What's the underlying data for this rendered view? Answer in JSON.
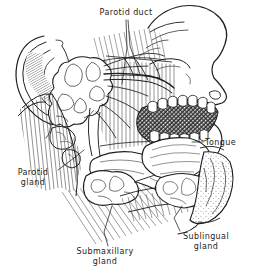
{
  "figure": {
    "style": "pen-and-ink engraving, black line art on white",
    "background_color": "#ffffff",
    "ink_color": "#1d1d1d"
  },
  "labels": [
    {
      "id": "parotid-duct",
      "text": "Parotid duct",
      "lines": [
        "Parotid duct"
      ],
      "position": "top-center"
    },
    {
      "id": "parotid-gland",
      "text": "Parotid gland",
      "lines": [
        "Parotid",
        "gland"
      ],
      "position": "left"
    },
    {
      "id": "tongue",
      "text": "Tongue",
      "lines": [
        "Tongue"
      ],
      "position": "right"
    },
    {
      "id": "submaxillary-gland",
      "text": "Submaxillary gland",
      "lines": [
        "Submaxillary",
        "gland"
      ],
      "position": "bottom-center"
    },
    {
      "id": "sublingual-gland",
      "text": "Sublingual gland",
      "lines": [
        "Sublingual",
        "gland"
      ],
      "position": "bottom-right"
    }
  ],
  "label_text": {
    "parotid_duct": "Parotid duct",
    "parotid_gland_line1": "Parotid",
    "parotid_gland_line2": "gland",
    "tongue": "Tongue",
    "submaxillary_line1": "Submaxillary",
    "submaxillary_line2": "gland",
    "sublingual_line1": "Sublingual",
    "sublingual_line2": "gland"
  },
  "structures": [
    "auricle (external ear)",
    "facial profile with brow, closed eye, nose and nostril",
    "upper and lower teeth rows",
    "open oral cavity",
    "tongue",
    "mandible",
    "parotid gland",
    "parotid duct",
    "submaxillary gland",
    "sublingual gland",
    "sternocleidomastoid muscle hatching",
    "masseter muscle hatching",
    "facial nerve branches",
    "chin and lips with stippling"
  ]
}
